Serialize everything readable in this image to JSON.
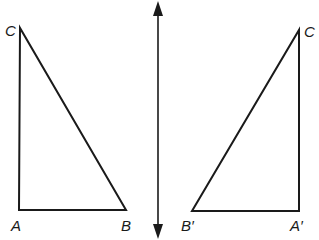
{
  "figure": {
    "stroke_color": "#1a1a1a",
    "background": "#ffffff"
  },
  "original_triangle": {
    "vertices": {
      "C": {
        "label": "C",
        "x": 20,
        "y": 28
      },
      "A": {
        "label": "A",
        "x": 19,
        "y": 210
      },
      "B": {
        "label": "B",
        "x": 126,
        "y": 210
      }
    }
  },
  "reflection_line": {
    "x": 158,
    "y_top": 2,
    "y_bottom": 238,
    "arrowheads": "both"
  },
  "image_triangle": {
    "vertices": {
      "C": {
        "label": "C",
        "x": 299,
        "y": 30
      },
      "A": {
        "label": "A′",
        "x": 299,
        "y": 211
      },
      "B": {
        "label": "B′",
        "x": 192,
        "y": 211
      }
    }
  }
}
